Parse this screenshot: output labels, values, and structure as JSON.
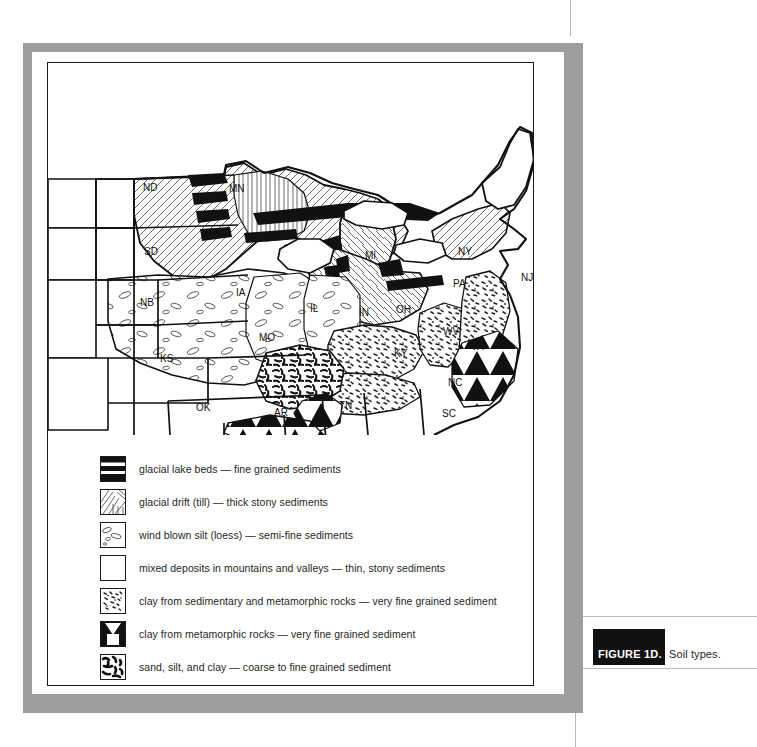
{
  "figure": {
    "tag": "FIGURE 1D.",
    "caption": "Soil types."
  },
  "map": {
    "title": "Soil types map of the central and eastern United States",
    "state_labels": [
      {
        "abbr": "ND",
        "x": 95,
        "y": 128
      },
      {
        "abbr": "MN",
        "x": 181,
        "y": 129
      },
      {
        "abbr": "SD",
        "x": 96,
        "y": 192
      },
      {
        "abbr": "WI",
        "x": 235,
        "y": 175
      },
      {
        "abbr": "MI",
        "x": 317,
        "y": 196
      },
      {
        "abbr": "NY",
        "x": 410,
        "y": 192
      },
      {
        "abbr": "NB",
        "x": 92,
        "y": 243
      },
      {
        "abbr": "IA",
        "x": 188,
        "y": 233
      },
      {
        "abbr": "IL",
        "x": 262,
        "y": 249
      },
      {
        "abbr": "IN",
        "x": 311,
        "y": 253
      },
      {
        "abbr": "OH",
        "x": 348,
        "y": 250
      },
      {
        "abbr": "PA",
        "x": 405,
        "y": 224
      },
      {
        "abbr": "NJ",
        "x": 473,
        "y": 218
      },
      {
        "abbr": "MO",
        "x": 211,
        "y": 278
      },
      {
        "abbr": "WV",
        "x": 395,
        "y": 272
      },
      {
        "abbr": "KS",
        "x": 112,
        "y": 299
      },
      {
        "abbr": "KY",
        "x": 346,
        "y": 294
      },
      {
        "abbr": "VA",
        "x": 423,
        "y": 287
      },
      {
        "abbr": "OK",
        "x": 148,
        "y": 348
      },
      {
        "abbr": "AR",
        "x": 226,
        "y": 353
      },
      {
        "abbr": "TN",
        "x": 291,
        "y": 346
      },
      {
        "abbr": "NC",
        "x": 400,
        "y": 323
      },
      {
        "abbr": "SC",
        "x": 394,
        "y": 354
      }
    ]
  },
  "legend": {
    "items": [
      {
        "pattern": "glacial-lake-beds-swatch",
        "label": "glacial lake beds — fine grained sediments"
      },
      {
        "pattern": "glacial-drift-swatch",
        "label": "glacial drift (till) —  thick stony sediments"
      },
      {
        "pattern": "wind-blown-silt-swatch",
        "label": "wind blown silt (loess) — semi-fine sediments"
      },
      {
        "pattern": "mixed-deposits-swatch",
        "label": "mixed deposits in mountains and valleys — thin, stony sediments"
      },
      {
        "pattern": "clay-sedimentary-metamorphic-swatch",
        "label": "clay from sedimentary and metamorphic rocks — very fine grained sediment"
      },
      {
        "pattern": "clay-metamorphic-swatch",
        "label": "clay from metamorphic rocks — very fine grained sediment"
      },
      {
        "pattern": "sand-silt-clay-swatch",
        "label": "sand, silt, and clay — coarse to fine grained sediment"
      }
    ]
  },
  "colors": {
    "frame_grey": "#9d9d9d",
    "ink": "#1a1a1a",
    "caption_tag_bg": "#111111",
    "paper": "#ffffff"
  }
}
